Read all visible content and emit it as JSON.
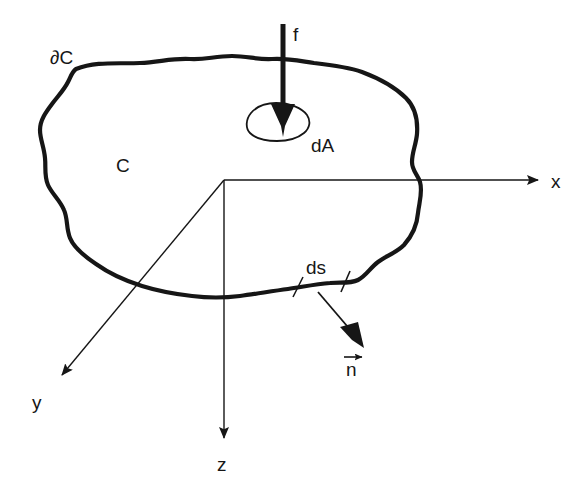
{
  "figure": {
    "background_color": "#ffffff",
    "ink_color": "#161616",
    "width": 587,
    "height": 489
  },
  "labels": {
    "boundary": "∂C",
    "region": "C",
    "force": "f",
    "area_element": "dA",
    "arc_element": "ds",
    "normal": "n",
    "axis_x": "x",
    "axis_y": "y",
    "axis_z": "z"
  },
  "geometry": {
    "origin": {
      "x": 224,
      "y": 180
    },
    "axis_x_end": {
      "x": 545,
      "y": 180
    },
    "axis_y_end": {
      "x": 55,
      "y": 382
    },
    "axis_z_end": {
      "x": 224,
      "y": 447
    },
    "force_arrow": {
      "x": 283,
      "y_start": 24,
      "y_end": 137
    },
    "normal_arrow": {
      "x_start": 318,
      "y_start": 292,
      "x_end": 363,
      "y_end": 345
    },
    "ds_ticks": [
      {
        "x": 298,
        "y": 287
      },
      {
        "x": 345,
        "y": 281
      }
    ],
    "boundary_stroke_width": 4.2,
    "axis_stroke_width": 1.4
  },
  "label_positions": {
    "boundary": {
      "x": 50,
      "y": 64
    },
    "region": {
      "x": 116,
      "y": 172
    },
    "force": {
      "x": 293,
      "y": 40
    },
    "area_element": {
      "x": 312,
      "y": 150
    },
    "arc_element": {
      "x": 307,
      "y": 272
    },
    "normal": {
      "x": 344,
      "y": 375
    },
    "axis_x": {
      "x": 551,
      "y": 187
    },
    "axis_y": {
      "x": 33,
      "y": 408
    },
    "axis_z": {
      "x": 217,
      "y": 470
    }
  }
}
